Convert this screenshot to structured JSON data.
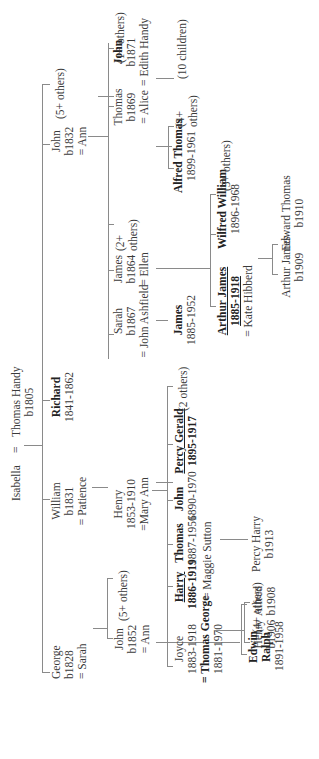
{
  "root": {
    "father": "Thomas Handy",
    "father_birth": "b1805",
    "marriage_sign": "=",
    "mother": "Isabella"
  },
  "gen1": {
    "george": {
      "name": "George",
      "born": "b1828",
      "spouse": "= Sarah"
    },
    "william": {
      "name": "William",
      "born": "b1831",
      "spouse": "= Patience"
    },
    "richard": {
      "name": "Richard",
      "dates": "1841-1862"
    },
    "john": {
      "name": "John",
      "born": "b1832",
      "spouse": "= Ann",
      "others": "(5+ others)"
    }
  },
  "gen2": {
    "john_b1852": {
      "name": "John",
      "born": "b1852",
      "spouse": "= Ann",
      "others": "(5+ others)"
    },
    "henry": {
      "name": "Henry",
      "dates": "1853-1910",
      "spouse": "=Mary Ann"
    },
    "sarah": {
      "name": "Sarah",
      "born": "b1867",
      "spouse": "= John Ashfield"
    },
    "james_b1864": {
      "name": "James",
      "born": "b1864",
      "spouse": "= Ellen",
      "others": "(2+ others)"
    },
    "thomas_b1869": {
      "name": "Thomas",
      "born": "b1869",
      "spouse": "= Alice"
    },
    "john_b1871": {
      "name": "John",
      "born": "b1871",
      "spouse": "= Edith Handy",
      "others": "(1+ others)"
    }
  },
  "gen3": {
    "edwin_ralph": {
      "name_line1": "Edwin",
      "name_line2": "Ralph",
      "dates": "1891-1958",
      "others": "(4+ others)"
    },
    "joyce": {
      "name": "Joyce",
      "dates": "1883-1918",
      "spouse": "= Thomas George",
      "spouse_dates": "1881-1970"
    },
    "harry": {
      "name": "Harry",
      "dates": "1886-1919"
    },
    "thomas": {
      "name": "Thomas",
      "dates": "1887-1956",
      "spouse": "= Maggie Sutton"
    },
    "john": {
      "name": "John",
      "dates": "1890-1970"
    },
    "percy_gerald": {
      "name": "Percy Gerald",
      "dates": "1895-1917",
      "others": "(2 others)"
    },
    "james_1885": {
      "name": "James",
      "dates": "1885-1952"
    },
    "arthur_james": {
      "name": "Arthur James",
      "dates": "1885-1918",
      "spouse": "= Kate Hibberd"
    },
    "wilfred_william": {
      "name": "Wilfred William",
      "dates": "1896-1968",
      "others": "(5+ others)"
    },
    "alfred_thomas": {
      "name": "Alfred Thomas",
      "dates": "1899-1961",
      "others": "(4+ others)"
    },
    "edith_children": "(10 children)"
  },
  "gen4": {
    "henry": {
      "name": "Henry",
      "born": "b1906"
    },
    "alfred": {
      "name": "Alfred",
      "born": "b1908"
    },
    "percy_harry": {
      "name": "Percy Harry",
      "born": "b1913"
    },
    "arthur_james": {
      "name": "Arthur James",
      "born": "b1909"
    },
    "edward_thomas": {
      "name": "Edward Thomas",
      "born": "b1910"
    }
  }
}
